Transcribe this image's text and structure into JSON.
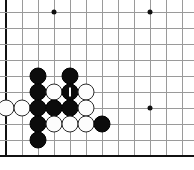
{
  "board": {
    "title": "Go board position",
    "type": "go-goban",
    "columns": 12,
    "rows": 10,
    "cell_size": 16,
    "origin_x": 6,
    "origin_y": 12,
    "line_color": "#9a9a9a",
    "edge_color": "#111111",
    "background_color": "#ffffff",
    "black_color": "#0c0c0c",
    "white_color": "#fdfdfd",
    "edges": {
      "left": true,
      "top": false,
      "right": false,
      "bottom": true
    },
    "star_points": [
      {
        "col": 3,
        "row": 0
      },
      {
        "col": 9,
        "row": 0
      },
      {
        "col": 9,
        "row": 6
      }
    ],
    "stones": [
      {
        "col": 2,
        "row": 4,
        "color": "black"
      },
      {
        "col": 4,
        "row": 4,
        "color": "black"
      },
      {
        "col": 2,
        "row": 5,
        "color": "black"
      },
      {
        "col": 3,
        "row": 5,
        "color": "white"
      },
      {
        "col": 4,
        "row": 5,
        "color": "black",
        "marker": "last-move"
      },
      {
        "col": 5,
        "row": 5,
        "color": "white"
      },
      {
        "col": 0,
        "row": 6,
        "color": "white"
      },
      {
        "col": 1,
        "row": 6,
        "color": "white"
      },
      {
        "col": 2,
        "row": 6,
        "color": "black"
      },
      {
        "col": 3,
        "row": 6,
        "color": "black"
      },
      {
        "col": 4,
        "row": 6,
        "color": "black"
      },
      {
        "col": 5,
        "row": 6,
        "color": "white"
      },
      {
        "col": 2,
        "row": 7,
        "color": "black"
      },
      {
        "col": 3,
        "row": 7,
        "color": "white"
      },
      {
        "col": 4,
        "row": 7,
        "color": "white"
      },
      {
        "col": 5,
        "row": 7,
        "color": "white"
      },
      {
        "col": 6,
        "row": 7,
        "color": "black"
      },
      {
        "col": 2,
        "row": 8,
        "color": "black"
      }
    ],
    "counts": {
      "black_stones": 10,
      "white_stones": 8,
      "total_stones": 18
    }
  }
}
